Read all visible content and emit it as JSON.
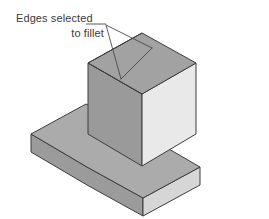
{
  "figure": {
    "title": "Edges selected to fillet",
    "background_color": "#FFFFFF",
    "outline_color": "#3D3D3D",
    "leader_color": "#4A4A4A",
    "text_color": "#3B3B3B"
  },
  "annotation": {
    "line1": "Edges selected",
    "line2": "to fillet",
    "font_size_px": 11,
    "leader_origin": {
      "x": 106,
      "y": 25
    },
    "leader_targets": [
      {
        "label": "top-left-edge-of-boss",
        "x": 152,
        "y": 48
      },
      {
        "label": "front-top-edge-of-boss",
        "x": 121,
        "y": 79
      }
    ]
  },
  "model": {
    "name": "boss-on-baseplate",
    "projection": "isometric",
    "parts": [
      {
        "name": "base-plate",
        "faces": [
          {
            "name": "base-top-face",
            "color": "#ABABAB"
          },
          {
            "name": "base-front-left-face",
            "color": "#9B9B9B"
          },
          {
            "name": "base-front-right-face",
            "color": "#D6D6D6"
          }
        ]
      },
      {
        "name": "boss-cube",
        "faces": [
          {
            "name": "boss-top-face",
            "color": "#A2A2A2"
          },
          {
            "name": "boss-front-left-face",
            "color": "#9A9A9A"
          },
          {
            "name": "boss-front-right-face",
            "color": "#E9E9E9"
          }
        ]
      }
    ]
  },
  "geometry": {
    "base_top": "31,134 86,104 143,134 200,167 143,198 87,167",
    "base_left_side": "31,134 31,152 87,185 87,167",
    "base_right_side": "87,185 143,216 200,185 200,167 143,198",
    "boss_top": "88,63 142,33 196,63 142,94",
    "boss_left_side": "88,63 88,134 142,166 142,94",
    "boss_right_side": "142,166 196,134 196,63 142,94",
    "boss_base_meet_left": "88,134 55,153",
    "boss_base_meet_right": "196,134 231,153"
  },
  "colors": {
    "edge": "#3D3D3D",
    "leader": "#4A4A4A",
    "text": "#3B3B3B",
    "white": "#FFFFFF"
  }
}
